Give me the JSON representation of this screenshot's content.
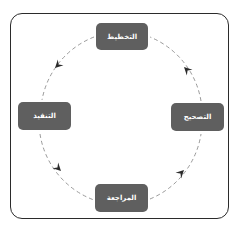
{
  "diagram": {
    "type": "cycle",
    "direction": "counter-clockwise",
    "nodes": [
      {
        "id": "top",
        "label": "التخطيط"
      },
      {
        "id": "left",
        "label": "التنفيذ"
      },
      {
        "id": "bottom",
        "label": "المراجعة"
      },
      {
        "id": "right",
        "label": "التصحيح"
      }
    ],
    "edges": [
      {
        "from": "التخطيط",
        "to": "التنفيذ"
      },
      {
        "from": "التنفيذ",
        "to": "المراجعة"
      },
      {
        "from": "المراجعة",
        "to": "التصحيح"
      },
      {
        "from": "التصحيح",
        "to": "التخطيط"
      }
    ],
    "colors": {
      "node_fill": "#5f5f5f",
      "node_text": "#ffffff",
      "connector": "#9a9a9a",
      "arrowhead": "#2b2b2b",
      "frame": "#2b2b2b"
    }
  }
}
